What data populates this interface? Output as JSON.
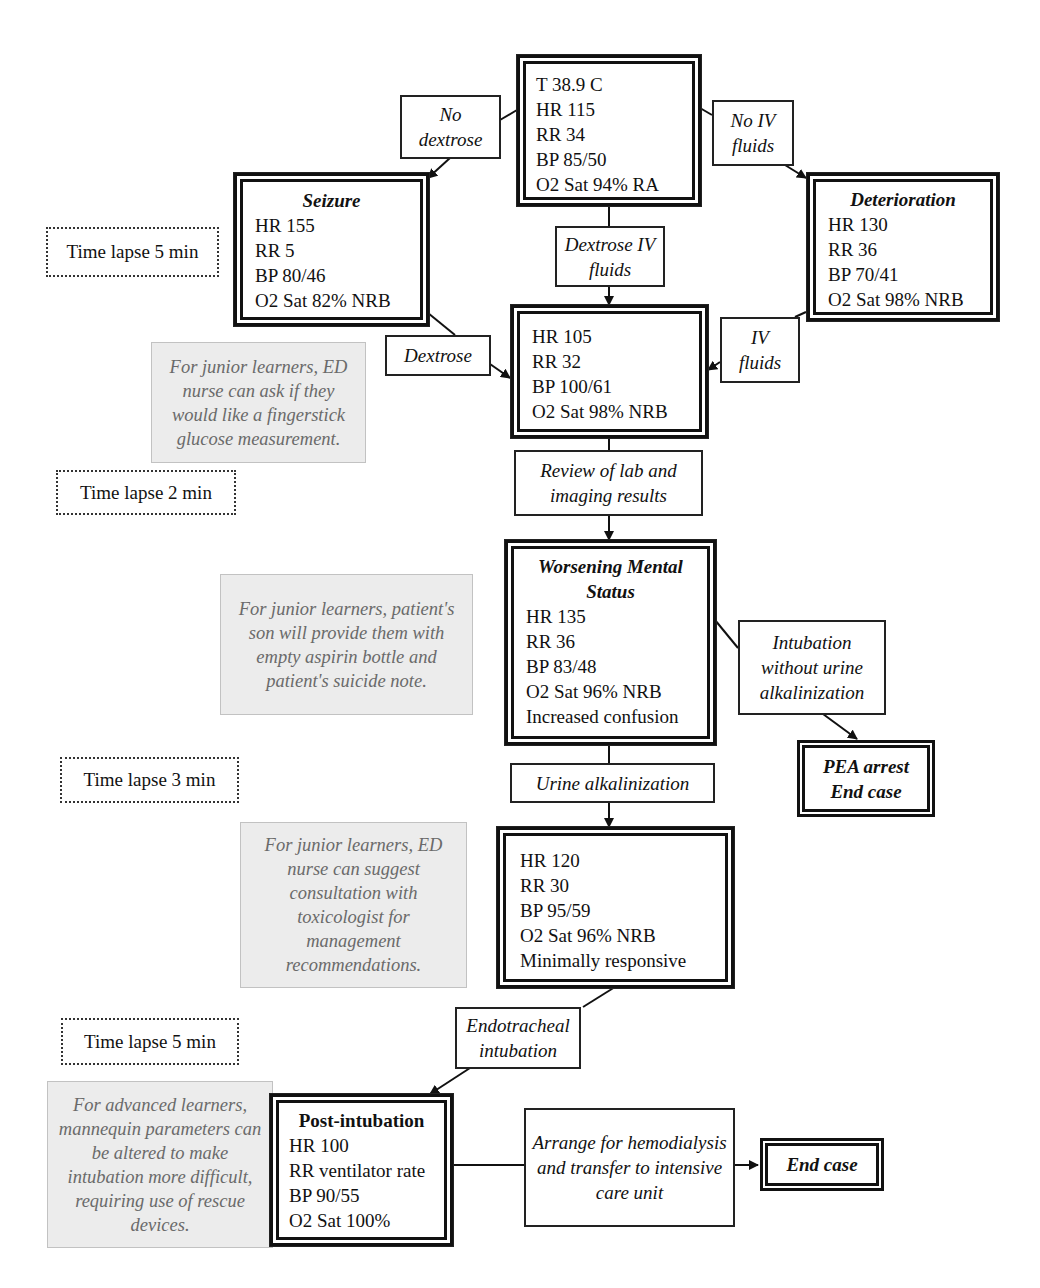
{
  "initial_state": {
    "lines": [
      "T 38.9 C",
      "HR 115",
      "RR 34",
      "BP 85/50",
      "O2 Sat 94% RA"
    ]
  },
  "actions": {
    "no_dextrose": "No dextrose",
    "no_iv_fluids": "No IV fluids",
    "dextrose_iv_fluids": "Dextrose IV fluids",
    "dextrose": "Dextrose",
    "iv_fluids": "IV fluids",
    "review_results": "Review of lab and imaging results",
    "intubation_without_alkalinization": "Intubation without urine alkalinization",
    "urine_alkalinization": "Urine alkalinization",
    "endotracheal_intubation": "Endotracheal intubation",
    "arrange_hemodialysis": "Arrange for hemodialysis and transfer to intensive care unit"
  },
  "seizure_state": {
    "title": "Seizure",
    "lines": [
      "HR 155",
      "RR 5",
      "BP 80/46",
      "O2 Sat 82% NRB"
    ]
  },
  "deterioration_state": {
    "title": "Deterioration",
    "lines": [
      "HR 130",
      "RR 36",
      "BP 70/41",
      "O2 Sat 98% NRB"
    ]
  },
  "improved_state": {
    "lines": [
      "HR 105",
      "RR 32",
      "BP 100/61",
      "O2 Sat 98% NRB"
    ]
  },
  "worsening_state": {
    "title_line1": "Worsening Mental",
    "title_line2": "Status",
    "lines": [
      "HR 135",
      "RR 36",
      "BP 83/48",
      "O2 Sat 96% NRB",
      "Increased confusion"
    ]
  },
  "alkalinized_state": {
    "lines": [
      "HR 120",
      "RR 30",
      "BP 95/59",
      "O2 Sat 96% NRB",
      "Minimally responsive"
    ]
  },
  "post_intubation_state": {
    "title": "Post-intubation",
    "lines": [
      "HR 100",
      "RR ventilator rate",
      "BP 90/55",
      "O2 Sat 100%"
    ]
  },
  "end_states": {
    "pea_line1": "PEA arrest",
    "pea_line2": "End case",
    "end_case": "End case"
  },
  "time_lapses": [
    "Time lapse 5 min",
    "Time lapse 2 min",
    "Time lapse 3 min",
    "Time lapse 5 min"
  ],
  "notes": [
    "For junior learners, ED nurse can ask if they would like a fingerstick glucose measurement.",
    "For junior learners, patient's son will provide them with empty aspirin bottle and patient's suicide note.",
    "For junior learners, ED nurse can suggest consultation with toxicologist for management recommendations.",
    "For advanced learners, mannequin parameters can be altered to make intubation more difficult, requiring use of rescue devices."
  ]
}
